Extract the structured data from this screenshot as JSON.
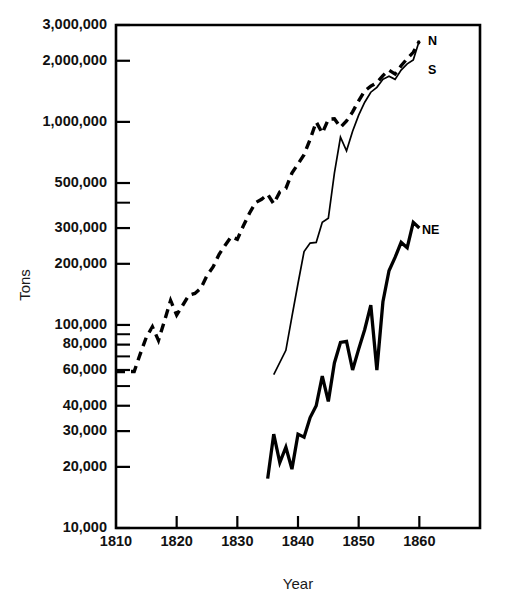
{
  "chart_data": {
    "type": "line",
    "title": "",
    "xlabel": "Year",
    "ylabel": "Tons",
    "y_scale": "log",
    "ylim": [
      10000,
      3000000
    ],
    "xlim": [
      1810,
      1870
    ],
    "grid": false,
    "legend_position": "right-inline",
    "y_ticks_labeled": [
      "3,000,000",
      "2,000,000",
      "1,000,000",
      "500,000",
      "300,000",
      "200,000",
      "100,000",
      "80,000",
      "60,000",
      "40,000",
      "30,000",
      "20,000",
      "10,000"
    ],
    "y_tick_values": [
      3000000,
      2000000,
      1000000,
      500000,
      300000,
      200000,
      100000,
      80000,
      60000,
      40000,
      30000,
      20000,
      10000
    ],
    "y_ticks_unlabeled": [
      400000,
      90000,
      70000,
      50000
    ],
    "x_ticks": [
      "1810",
      "1820",
      "1830",
      "1840",
      "1850",
      "1860"
    ],
    "x_tick_values": [
      1810,
      1820,
      1830,
      1840,
      1850,
      1860
    ],
    "series": [
      {
        "name": "N",
        "label": "N",
        "style": "dashed",
        "x": [
          1810,
          1813,
          1814,
          1815,
          1816,
          1817,
          1818,
          1819,
          1820,
          1821,
          1822,
          1823,
          1824,
          1825,
          1826,
          1827,
          1828,
          1829,
          1830,
          1831,
          1832,
          1833,
          1834,
          1835,
          1836,
          1837,
          1838,
          1839,
          1840,
          1841,
          1842,
          1843,
          1844,
          1845,
          1846,
          1847,
          1848,
          1849,
          1850,
          1851,
          1852,
          1853,
          1854,
          1855,
          1856,
          1857,
          1858,
          1859,
          1860
        ],
        "values": [
          59000,
          59000,
          72000,
          87000,
          98000,
          84000,
          105000,
          132000,
          112000,
          125000,
          140000,
          143000,
          152000,
          175000,
          193000,
          223000,
          247000,
          272000,
          264000,
          308000,
          355000,
          400000,
          416000,
          440000,
          395000,
          452000,
          470000,
          560000,
          620000,
          690000,
          820000,
          1000000,
          880000,
          1030000,
          1035000,
          940000,
          1010000,
          1120000,
          1270000,
          1420000,
          1500000,
          1560000,
          1690000,
          1800000,
          1720000,
          1890000,
          2050000,
          2200000,
          2500000
        ]
      },
      {
        "name": "S",
        "label": "S",
        "style": "thin-solid",
        "x": [
          1836,
          1838,
          1839,
          1840,
          1841,
          1842,
          1843,
          1844,
          1845,
          1846,
          1847,
          1848,
          1849,
          1850,
          1851,
          1852,
          1853,
          1854,
          1855,
          1856,
          1857,
          1858,
          1859,
          1860
        ],
        "values": [
          57000,
          75000,
          110000,
          160000,
          230000,
          253000,
          255000,
          320000,
          335000,
          560000,
          840000,
          720000,
          900000,
          1080000,
          1250000,
          1400000,
          1480000,
          1620000,
          1680000,
          1620000,
          1800000,
          1930000,
          2020000,
          2520000
        ]
      },
      {
        "name": "NE",
        "label": "NE",
        "style": "thick-solid",
        "x": [
          1835,
          1836,
          1837,
          1838,
          1839,
          1840,
          1841,
          1842,
          1843,
          1844,
          1845,
          1846,
          1847,
          1848,
          1849,
          1850,
          1851,
          1852,
          1853,
          1854,
          1855,
          1856,
          1857,
          1858,
          1859,
          1860
        ],
        "values": [
          17500,
          29000,
          21000,
          25000,
          19500,
          29000,
          28000,
          35000,
          40000,
          56000,
          42000,
          65000,
          82000,
          83000,
          60000,
          76000,
          95000,
          125000,
          60000,
          130000,
          185000,
          215000,
          255000,
          240000,
          320000,
          300000
        ]
      }
    ]
  },
  "axes": {
    "y_axis_title": "Tons",
    "x_axis_title": "Year"
  }
}
